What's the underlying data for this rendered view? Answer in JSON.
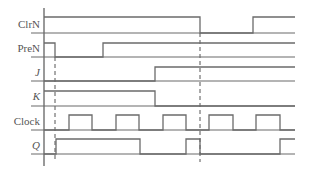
{
  "diagram": {
    "type": "timing-diagram",
    "signals": [
      {
        "name": "ClrN",
        "italic": false,
        "high_y": 17,
        "base_y": 33,
        "points": "44,17 200,17 200,33 253,33 253,17 295,17"
      },
      {
        "name": "PreN",
        "italic": false,
        "high_y": 43,
        "base_y": 57,
        "points": "44,43 55,43 55,57 103,57 103,43 295,43"
      },
      {
        "name": "J",
        "italic": true,
        "high_y": 67,
        "base_y": 81,
        "points": "44,81 155,81 155,67 295,67"
      },
      {
        "name": "K",
        "italic": true,
        "high_y": 91,
        "base_y": 106,
        "points": "44,91 155,91 155,106 295,106"
      },
      {
        "name": "Clock",
        "italic": false,
        "high_y": 115,
        "base_y": 130,
        "points": "44,130 69,130 69,115 92,115 92,130 116,130 116,115 139,115 139,130 163,130 163,115 186,115 186,130 209,130 209,115 233,115 233,130 256,130 256,115 280,115 280,130 295,130"
      },
      {
        "name": "Q",
        "italic": true,
        "high_y": 139,
        "base_y": 154,
        "points": "44,154 56,154 56,139 140,139 140,154 186,154 186,139 200,139 200,154 280,154 280,139 295,139"
      }
    ],
    "markers": [
      {
        "name": "preset-marker",
        "x": 55
      },
      {
        "name": "clear-marker",
        "x": 200
      }
    ],
    "colors": {
      "line": "#6b6b6b",
      "text": "#555555",
      "background": "#ffffff"
    }
  }
}
